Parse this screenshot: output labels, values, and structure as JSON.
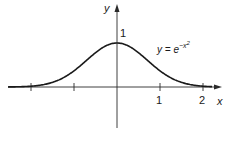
{
  "chart_data": {
    "type": "line",
    "title": "",
    "function": "y = e^(-x^2)",
    "xlabel": "x",
    "ylabel": "y",
    "xlim": [
      -2.7,
      2.4
    ],
    "ylim": [
      -0.95,
      1.85
    ],
    "x_ticks": [
      -2,
      -1,
      1,
      2
    ],
    "x_tick_labels": [
      "",
      "",
      "1",
      "2"
    ],
    "y_tick_labels": [
      "1"
    ],
    "grid": false,
    "legend": null,
    "annotations": [
      {
        "text": "y = e^{-x^2}",
        "x": 0.95,
        "y": 0.9
      }
    ],
    "series": [
      {
        "name": "y = e^{-x^2}",
        "x": [
          -2.5,
          -2.0,
          -1.5,
          -1.0,
          -0.5,
          0,
          0.5,
          1.0,
          1.5,
          2.0
        ],
        "values": [
          0.002,
          0.018,
          0.105,
          0.368,
          0.779,
          1.0,
          0.779,
          0.368,
          0.105,
          0.018
        ]
      }
    ]
  },
  "labels": {
    "y_axis": "y",
    "x_axis": "x",
    "y_one": "1",
    "x_one": "1",
    "x_two": "2",
    "eq_lhs": "y = e",
    "eq_exp": "−x",
    "eq_pow": "2"
  },
  "colors": {
    "axis": "#2a2a2a",
    "curve": "#1a1a1a"
  }
}
